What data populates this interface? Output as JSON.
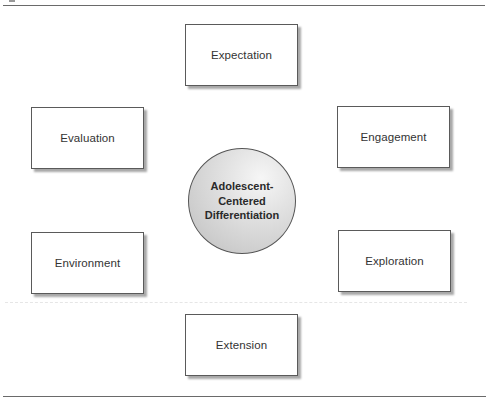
{
  "diagram": {
    "center": {
      "lines": [
        "Adolescent-",
        "Centered",
        "Differentiation"
      ],
      "fill_color": "#d4d4d4"
    },
    "nodes": {
      "expectation": "Expectation",
      "evaluation": "Evaluation",
      "engagement": "Engagement",
      "environment": "Environment",
      "exploration": "Exploration",
      "extension": "Extension"
    }
  }
}
